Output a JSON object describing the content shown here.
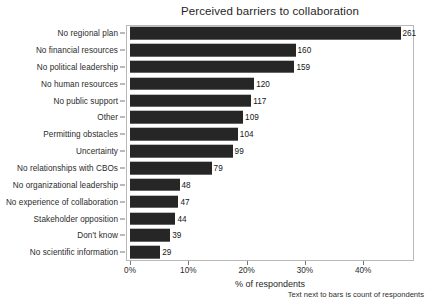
{
  "chart_data": {
    "type": "bar",
    "orientation": "horizontal",
    "title": "Perceived barriers to collaboration",
    "xlabel": "% of respondents",
    "ylabel": "",
    "caption": "Text next to bars is count of respondents",
    "grid": false,
    "legend": null,
    "xlim": [
      0,
      49.4
    ],
    "xticks": [
      0,
      10,
      20,
      30,
      40
    ],
    "xtick_labels": [
      "0%",
      "10%",
      "20%",
      "30%",
      "40%"
    ],
    "value_label_source": "count of respondents",
    "respondent_base": 563,
    "categories": [
      "No regional plan",
      "No financial resources",
      "No political leadership",
      "No human resources",
      "No public support",
      "Other",
      "Permitting obstacles",
      "Uncertainty",
      "No relationships with CBOs",
      "No organizational leadership",
      "No experience of collaboration",
      "Stakeholder opposition",
      "Don't know",
      "No scientific information"
    ],
    "counts": [
      261,
      160,
      159,
      120,
      117,
      109,
      104,
      99,
      79,
      48,
      47,
      44,
      39,
      29
    ],
    "percents": [
      46.4,
      28.4,
      28.2,
      21.3,
      20.8,
      19.4,
      18.5,
      17.6,
      14.0,
      8.5,
      8.3,
      7.8,
      6.9,
      5.2
    ],
    "bar_color": "#262626"
  }
}
